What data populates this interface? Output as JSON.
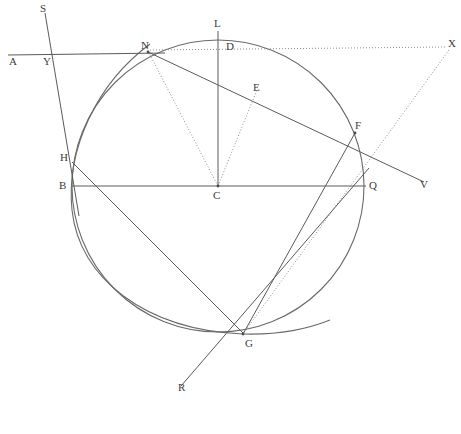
{
  "figure": {
    "canvas": {
      "width": 461,
      "height": 434
    },
    "colors": {
      "background": "#ffffff",
      "line": "#5a5a5a",
      "circle": "#6a6a6a",
      "dotted": "#8d8d8d",
      "label": "#3c3c3c"
    },
    "circle": {
      "center_label": "C",
      "cx": 218,
      "cy": 186,
      "r": 146
    },
    "arc": {
      "description": "second arc through N, H, G",
      "cx": 372,
      "cy": 212,
      "r": 302
    },
    "labels": [
      {
        "name": "S",
        "text": "S",
        "x": 40,
        "y": 3
      },
      {
        "name": "L",
        "text": "L",
        "x": 214,
        "y": 18
      },
      {
        "name": "X",
        "text": "X",
        "x": 448,
        "y": 38
      },
      {
        "name": "N",
        "text": "N",
        "x": 141,
        "y": 40
      },
      {
        "name": "D",
        "text": "D",
        "x": 226,
        "y": 41
      },
      {
        "name": "A",
        "text": "A",
        "x": 9,
        "y": 56
      },
      {
        "name": "Y",
        "text": "Y",
        "x": 43,
        "y": 56
      },
      {
        "name": "E",
        "text": "E",
        "x": 253,
        "y": 82
      },
      {
        "name": "F",
        "text": "F",
        "x": 355,
        "y": 120
      },
      {
        "name": "H",
        "text": "H",
        "x": 60,
        "y": 152
      },
      {
        "name": "B",
        "text": "B",
        "x": 59,
        "y": 180
      },
      {
        "name": "C",
        "text": "C",
        "x": 213,
        "y": 190
      },
      {
        "name": "Q",
        "text": "Q",
        "x": 369,
        "y": 180
      },
      {
        "name": "V",
        "text": "V",
        "x": 420,
        "y": 179
      },
      {
        "name": "G",
        "text": "G",
        "x": 245,
        "y": 338
      },
      {
        "name": "R",
        "text": "R",
        "x": 178,
        "y": 382
      }
    ],
    "vertices": [
      {
        "name": "C",
        "x": 218,
        "y": 186
      },
      {
        "name": "N",
        "x": 148,
        "y": 52
      },
      {
        "name": "F",
        "x": 355,
        "y": 133
      },
      {
        "name": "G",
        "x": 243,
        "y": 334
      },
      {
        "name": "H",
        "x": 72,
        "y": 162
      },
      {
        "name": "Q",
        "x": 365,
        "y": 186
      }
    ],
    "segments": [
      {
        "name": "line-A-to-N-secant",
        "style": "solid",
        "x1": 8,
        "y1": 55,
        "x2": 165,
        "y2": 53
      },
      {
        "name": "line-S-through-Y-H",
        "style": "solid",
        "x1": 45,
        "y1": 13,
        "x2": 79,
        "y2": 216
      },
      {
        "name": "line-N-to-F-to-V",
        "style": "solid",
        "x1": 148,
        "y1": 52,
        "x2": 424,
        "y2": 182
      },
      {
        "name": "line-L-D-to-C",
        "style": "solid",
        "x1": 218,
        "y1": 31,
        "x2": 218,
        "y2": 186
      },
      {
        "name": "line-B-to-Q-diameter",
        "style": "solid",
        "x1": 72,
        "y1": 186,
        "x2": 366,
        "y2": 186
      },
      {
        "name": "line-H-to-G",
        "style": "solid",
        "x1": 72,
        "y1": 162,
        "x2": 244,
        "y2": 334
      },
      {
        "name": "line-F-to-G",
        "style": "solid",
        "x1": 355,
        "y1": 133,
        "x2": 243,
        "y2": 334
      },
      {
        "name": "line-Q-to-G-to-R",
        "style": "solid",
        "x1": 369,
        "y1": 168,
        "x2": 181,
        "y2": 386
      },
      {
        "name": "dotted-N-to-X",
        "style": "dotted",
        "x1": 150,
        "y1": 50,
        "x2": 446,
        "y2": 47
      },
      {
        "name": "dotted-C-to-N",
        "style": "dotted",
        "x1": 218,
        "y1": 186,
        "x2": 149,
        "y2": 53
      },
      {
        "name": "dotted-C-to-E",
        "style": "dotted",
        "x1": 218,
        "y1": 186,
        "x2": 257,
        "y2": 90
      },
      {
        "name": "dotted-X-to-G",
        "style": "dotted",
        "x1": 449,
        "y1": 50,
        "x2": 243,
        "y2": 334
      }
    ]
  }
}
